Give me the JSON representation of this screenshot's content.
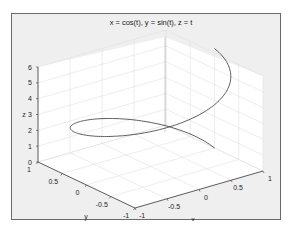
{
  "figure": {
    "background": "#efefef",
    "axes_pane_color": "#ffffff",
    "grid_color": "#e3e3e3",
    "line_color": "#555555"
  },
  "chart_data": {
    "type": "line3d",
    "title": "x = cos(t), y = sin(t), z = t",
    "xlabel": "x",
    "ylabel": "y",
    "zlabel": "z",
    "xlim": [
      -1,
      1
    ],
    "ylim": [
      -1,
      1
    ],
    "zlim": [
      0,
      6.2832
    ],
    "xticks": [
      "-1",
      "-0.5",
      "0",
      "0.5",
      "1"
    ],
    "yticks": [
      "-1",
      "-0.5",
      "0",
      "0.5",
      "1"
    ],
    "zticks": [
      "0",
      "1",
      "2",
      "3",
      "4",
      "5",
      "6"
    ],
    "grid": true,
    "series": [
      {
        "name": "helix",
        "parametric": "x=cos(t), y=sin(t), z=t",
        "t_range": [
          0,
          6.2832
        ],
        "samples": [
          {
            "t": 0,
            "x": 1,
            "y": 0,
            "z": 0
          },
          {
            "t": 1.5708,
            "x": 0,
            "y": 1,
            "z": 1.5708
          },
          {
            "t": 3.1416,
            "x": -1,
            "y": 0,
            "z": 3.1416
          },
          {
            "t": 4.7124,
            "x": 0,
            "y": -1,
            "z": 4.7124
          },
          {
            "t": 6.2832,
            "x": 1,
            "y": 0,
            "z": 6.2832
          }
        ]
      }
    ]
  }
}
